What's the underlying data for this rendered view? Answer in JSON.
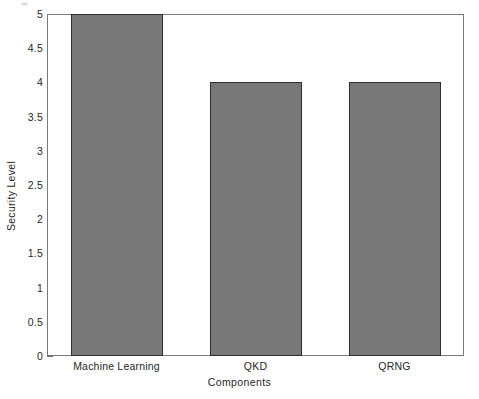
{
  "chart_data": {
    "type": "bar",
    "title": "",
    "xlabel": "Components",
    "ylabel": "Security Level",
    "categories": [
      "Machine Learning",
      "QKD",
      "QRNG"
    ],
    "values": [
      5,
      4,
      4
    ],
    "ylim": [
      0,
      5
    ],
    "ytick_labels": [
      "0",
      "0.5",
      "1",
      "1.5",
      "2",
      "2.5",
      "3",
      "3.5",
      "4",
      "4.5",
      "5"
    ],
    "ytick_values": [
      0,
      0.5,
      1,
      1.5,
      2,
      2.5,
      3,
      3.5,
      4,
      4.5,
      5
    ],
    "grid": false,
    "legend": null,
    "bar_fill_color": "#787878",
    "bar_edge_color": "#2e2e2e",
    "axes_color": "#7a7a7a",
    "background_color": "#ffffff"
  }
}
